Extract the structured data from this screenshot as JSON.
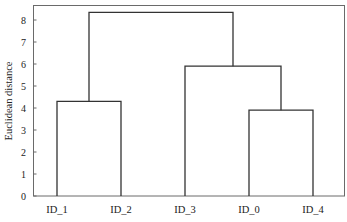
{
  "chart_data": {
    "type": "dendrogram",
    "title": "",
    "xlabel": "",
    "ylabel": "Euclidean distance",
    "ylim": [
      0,
      8.7
    ],
    "yticks": [
      0,
      1,
      2,
      3,
      4,
      5,
      6,
      7,
      8
    ],
    "grid": false,
    "legend": null,
    "leaves": [
      "ID_1",
      "ID_2",
      "ID_3",
      "ID_0",
      "ID_4"
    ],
    "merges": [
      {
        "left": "ID_0",
        "right": "ID_4",
        "height": 3.9,
        "id": "C1"
      },
      {
        "left": "ID_1",
        "right": "ID_2",
        "height": 4.3,
        "id": "C2"
      },
      {
        "left": "ID_3",
        "right": "C1",
        "height": 5.9,
        "id": "C3"
      },
      {
        "left": "C2",
        "right": "C3",
        "height": 8.35,
        "id": "C4"
      }
    ]
  },
  "axis": {
    "ylabel": "Euclidean distance",
    "ytick_labels": [
      "0",
      "1",
      "2",
      "3",
      "4",
      "5",
      "6",
      "7",
      "8"
    ],
    "xtick_labels": [
      "ID_1",
      "ID_2",
      "ID_3",
      "ID_0",
      "ID_4"
    ]
  }
}
